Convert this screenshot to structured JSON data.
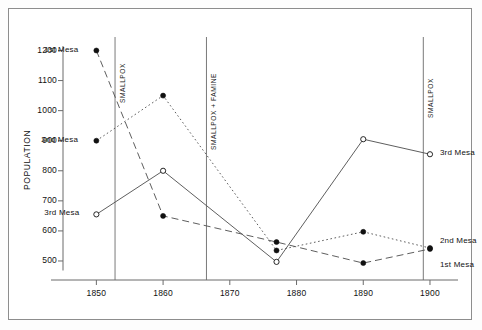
{
  "chart_data": {
    "type": "line",
    "title": "",
    "xlabel": "",
    "ylabel": "POPULATION",
    "xlim": [
      1845,
      1903
    ],
    "ylim": [
      470,
      1215
    ],
    "xticks": [
      "1850",
      "1860",
      "1870",
      "1880",
      "1890",
      "1900"
    ],
    "xtick_values": [
      1850,
      1860,
      1870,
      1880,
      1890,
      1900
    ],
    "yticks": [
      "500",
      "600",
      "700",
      "800",
      "900",
      "1000",
      "1100",
      "1200"
    ],
    "ytick_values": [
      500,
      600,
      700,
      800,
      900,
      1000,
      1100,
      1200
    ],
    "grid": false,
    "legend_position": "inline-endpoints",
    "series": [
      {
        "name": "1st Mesa",
        "marker": "filled-circle",
        "line_style": "dashed",
        "x": [
          1850,
          1860,
          1877,
          1890,
          1900
        ],
        "values": [
          1200,
          650,
          563,
          493,
          540
        ]
      },
      {
        "name": "2nd Mesa",
        "marker": "filled-circle",
        "line_style": "dotted",
        "x": [
          1850,
          1860,
          1877,
          1890,
          1900
        ],
        "values": [
          900,
          1050,
          535,
          597,
          543
        ]
      },
      {
        "name": "3rd Mesa",
        "marker": "open-circle",
        "line_style": "solid",
        "x": [
          1850,
          1860,
          1877,
          1890,
          1900
        ],
        "values": [
          655,
          800,
          497,
          905,
          855
        ]
      }
    ],
    "annotations": [
      {
        "label": "SMALLPOX",
        "x": 1852.8
      },
      {
        "label": "SMALLPOX + FAMINE",
        "x": 1866.5
      },
      {
        "label": "SMALLPOX",
        "x": 1899.0
      }
    ],
    "point_labels": [
      {
        "text": "1st Mesa",
        "series": "1st Mesa",
        "x": 1850,
        "y": 1200,
        "side": "left"
      },
      {
        "text": "2nd Mesa",
        "series": "2nd Mesa",
        "x": 1850,
        "y": 900,
        "side": "left"
      },
      {
        "text": "3rd Mesa",
        "series": "3rd Mesa",
        "x": 1850,
        "y": 655,
        "side": "left"
      },
      {
        "text": "3rd Mesa",
        "series": "3rd Mesa",
        "x": 1900,
        "y": 855,
        "side": "right"
      },
      {
        "text": "2nd Mesa",
        "series": "2nd Mesa",
        "x": 1900,
        "y": 543,
        "side": "right"
      },
      {
        "text": "1st Mesa",
        "series": "1st Mesa",
        "x": 1900,
        "y": 500,
        "side": "right"
      }
    ],
    "colors": {
      "axis": "#6b6b6b",
      "line": "#555555",
      "marker_fill": "#111111",
      "marker_open": "#ffffff",
      "text": "#111111",
      "frame": "#8d8d8d",
      "background": "#ffffff"
    }
  }
}
